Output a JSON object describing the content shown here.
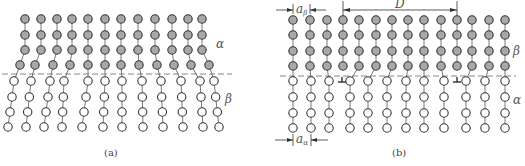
{
  "figure": {
    "panels": [
      {
        "id": "a",
        "caption": "(a)",
        "upper_phase_label": "α",
        "lower_phase_label": "β",
        "description": "Coherent interface: lattice planes bend across the interface",
        "upper_rows_y": [
          19,
          35,
          50,
          65
        ],
        "lower_rows_y": [
          81,
          97,
          112,
          127
        ],
        "interface_y": 74,
        "upper_columns_x": [
          25,
          41,
          57,
          72,
          88,
          105,
          121,
          138,
          155,
          172,
          188,
          202
        ],
        "upper_columns_bottom_x": [
          20,
          35,
          53,
          70,
          88,
          105,
          121,
          139,
          157,
          174,
          191,
          209
        ],
        "lower_columns_top_x": [
          14,
          31,
          50,
          64,
          88,
          105,
          122,
          142,
          161,
          181,
          200,
          214
        ],
        "lower_columns_bottom_x": [
          8,
          26,
          44,
          62,
          82,
          103,
          122,
          143,
          163,
          183,
          203,
          219
        ]
      },
      {
        "id": "b",
        "caption": "(b)",
        "upper_phase_label": "β",
        "lower_phase_label": "α",
        "description": "Semi-coherent interface with misfit dislocations spaced D apart",
        "upper_rows_y": [
          20,
          35,
          51,
          66
        ],
        "lower_rows_y": [
          81,
          97,
          113,
          128
        ],
        "interface_y": 76,
        "upper_columns_x": [
          293,
          310,
          327,
          343,
          359,
          376,
          392,
          408,
          424,
          441,
          457,
          472,
          489,
          505
        ],
        "lower_columns_x": [
          293,
          311,
          329,
          350,
          368,
          387,
          406,
          424,
          444,
          466,
          485,
          505
        ],
        "dislocations_x": [
          342,
          457
        ],
        "a_beta_label": "aβ",
        "a_alpha_label": "aα",
        "spacing_label": "D"
      }
    ]
  }
}
